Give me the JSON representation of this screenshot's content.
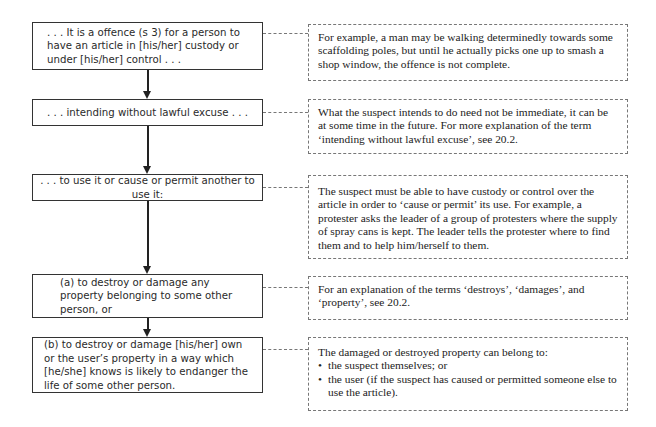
{
  "flowchart": {
    "steps": [
      {
        "id": "step-1",
        "text": ". . . It is a offence (s 3) for a person to have an article in [his/her] custody or under [his/her] control . . ."
      },
      {
        "id": "step-2",
        "text": ". . . intending without lawful excuse . . ."
      },
      {
        "id": "step-3",
        "text": ". . . to use it or cause or permit another to use it:"
      },
      {
        "id": "step-4",
        "text": "(a)  to destroy or damage any property belonging to some other person, or"
      },
      {
        "id": "step-5",
        "text": "(b)  to destroy or damage [his/her] own or the user’s property in a way which [he/she] knows is likely to endanger the life of some other person."
      }
    ],
    "notes": [
      {
        "id": "note-1",
        "text": "For example, a man may be walking determinedly towards some scaffolding poles, but until he actually picks one up to smash a shop window, the offence is not complete."
      },
      {
        "id": "note-2",
        "text": "What the suspect intends to do need not be immediate, it can be at some time in the future. For more explanation of the term ‘intending without lawful excuse’, see 20.2."
      },
      {
        "id": "note-3",
        "text": "The suspect must be able to have custody or control over the article in order to ‘cause or permit’ its use. For example, a protester asks the leader of a group of protesters where the supply of spray cans is kept. The leader tells the protester where to find them and to help him/herself to them."
      },
      {
        "id": "note-4",
        "text": "For an explanation of the terms ‘destroys’, ‘damages’, and ‘property’, see 20.2."
      },
      {
        "id": "note-5",
        "intro": "The damaged or destroyed property can belong to:",
        "bullets": [
          "the suspect themselves; or",
          "the user (if the suspect has caused or permitted someone else to use the article)."
        ]
      }
    ]
  }
}
